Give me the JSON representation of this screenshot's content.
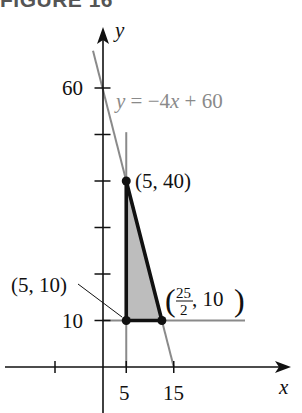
{
  "figure": {
    "title": "FIGURE 16"
  },
  "chart_data": {
    "type": "line",
    "title": "FIGURE 16",
    "xlabel": "x",
    "ylabel": "y",
    "xlim": [
      -11,
      39
    ],
    "ylim": [
      -8,
      73
    ],
    "grid": false,
    "x_ticks": [
      -10,
      5,
      15
    ],
    "x_tick_labels": [
      "",
      "5",
      "15"
    ],
    "y_ticks": [
      10,
      20,
      30,
      40,
      50,
      60
    ],
    "y_tick_labels": [
      "10",
      "",
      "",
      "",
      "",
      "60"
    ],
    "lines": [
      {
        "name": "y = -4x + 60",
        "equation": "y = −4x + 60",
        "color": "#8a8a8a",
        "from": [
          -2,
          68
        ],
        "to": [
          15,
          0
        ]
      },
      {
        "name": "x = 5",
        "color": "#8a8a8a",
        "from": [
          5,
          0
        ],
        "to": [
          5,
          50.5
        ]
      },
      {
        "name": "y = 10",
        "color": "#8a8a8a",
        "from": [
          0,
          10
        ],
        "to": [
          30,
          10
        ]
      }
    ],
    "feasible_region": {
      "vertices": [
        [
          5,
          40
        ],
        [
          5,
          10
        ],
        [
          12.5,
          10
        ]
      ],
      "fill": "#bdbdbd",
      "edge_color": "#111111"
    },
    "points": [
      {
        "x": 5,
        "y": 40,
        "label": "(5, 40)"
      },
      {
        "x": 5,
        "y": 10,
        "label": "(5, 10)"
      },
      {
        "x": 12.5,
        "y": 10,
        "label_num": "25",
        "label_den": "2",
        "label_rest": ", 10",
        "label": "(25/2, 10)"
      }
    ],
    "annotations": {
      "equation_label": "y = −4x + 60",
      "eq_y": "y",
      "eq_rest": " = −4",
      "eq_x": "x",
      "eq_tail": " + 60"
    }
  }
}
